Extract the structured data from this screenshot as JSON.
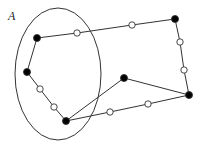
{
  "label": {
    "text": "A",
    "x": 8,
    "y": 9
  },
  "colors": {
    "stroke": "#333333",
    "fill_solid": "#000000",
    "fill_open": "#ffffff"
  },
  "ellipse": {
    "cx": 58,
    "cy": 74,
    "rx": 43,
    "ry": 66
  },
  "nodes": [
    {
      "id": "n1",
      "x": 37,
      "y": 38,
      "type": "solid"
    },
    {
      "id": "n2",
      "x": 77,
      "y": 33,
      "type": "open"
    },
    {
      "id": "n3",
      "x": 132,
      "y": 25,
      "type": "open"
    },
    {
      "id": "n4",
      "x": 175,
      "y": 19,
      "type": "solid"
    },
    {
      "id": "n5",
      "x": 180,
      "y": 42,
      "type": "open"
    },
    {
      "id": "n6",
      "x": 184,
      "y": 70,
      "type": "open"
    },
    {
      "id": "n7",
      "x": 189,
      "y": 95,
      "type": "solid"
    },
    {
      "id": "n8",
      "x": 148,
      "y": 104,
      "type": "open"
    },
    {
      "id": "n9",
      "x": 110,
      "y": 112,
      "type": "open"
    },
    {
      "id": "n10",
      "x": 66,
      "y": 121,
      "type": "solid"
    },
    {
      "id": "n11",
      "x": 54,
      "y": 107,
      "type": "open"
    },
    {
      "id": "n12",
      "x": 40,
      "y": 89,
      "type": "open"
    },
    {
      "id": "n13",
      "x": 27,
      "y": 72,
      "type": "solid"
    },
    {
      "id": "n14",
      "x": 124,
      "y": 78,
      "type": "solid"
    }
  ],
  "edges": [
    [
      "n1",
      "n2"
    ],
    [
      "n2",
      "n3"
    ],
    [
      "n3",
      "n4"
    ],
    [
      "n4",
      "n5"
    ],
    [
      "n5",
      "n6"
    ],
    [
      "n6",
      "n7"
    ],
    [
      "n7",
      "n8"
    ],
    [
      "n8",
      "n9"
    ],
    [
      "n9",
      "n10"
    ],
    [
      "n10",
      "n11"
    ],
    [
      "n11",
      "n12"
    ],
    [
      "n12",
      "n13"
    ],
    [
      "n13",
      "n1"
    ],
    [
      "n10",
      "n14"
    ],
    [
      "n14",
      "n7"
    ]
  ]
}
